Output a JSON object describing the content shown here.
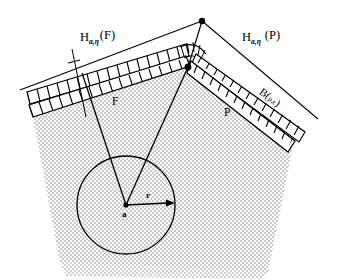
{
  "figure": {
    "labels": {
      "halfspace_left": {
        "base": "H",
        "subscript": "a,η",
        "argument": "(F)",
        "full": "H a,η (F)"
      },
      "halfspace_right": {
        "base": "H",
        "subscript": "a,η",
        "argument": "(P)",
        "full": "H a,η (P)"
      },
      "face_left": "F",
      "face_right": "P",
      "ball": {
        "base": "B",
        "open": "(",
        "center": "p",
        "comma": ",",
        "radius": "ϵ",
        "close": ")",
        "full": "B(p,ϵ)"
      },
      "center_point": "a",
      "radius": "r"
    },
    "colors": {
      "body_fill": "#d9d9d9",
      "stroke": "#000000",
      "band_fill": "#ffffff",
      "page": "#ffffff"
    },
    "geometry": {
      "apex_outer": [
        202,
        21
      ],
      "vertex_inner": [
        188,
        67
      ],
      "circle_center": [
        126,
        205
      ],
      "circle_radius": 49,
      "radius_arrow_tip": [
        170,
        203
      ]
    }
  }
}
